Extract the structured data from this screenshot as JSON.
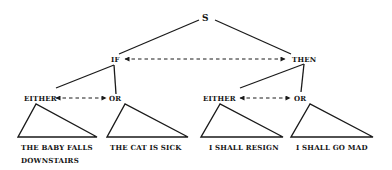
{
  "diagram": {
    "root": {
      "label": "S"
    },
    "level1": [
      {
        "id": "if",
        "label": "IF"
      },
      {
        "id": "then",
        "label": "THEN"
      }
    ],
    "level1_relation": {
      "from": "IF",
      "to": "THEN",
      "style": "dashed-bidirectional-arrow"
    },
    "level2": [
      {
        "parent": "IF",
        "either": "EITHER",
        "or": "OR"
      },
      {
        "parent": "THEN",
        "either": "EITHER",
        "or": "OR"
      }
    ],
    "leaves": [
      {
        "parent": "IF/EITHER",
        "line1": "THE BABY FALLS",
        "line2": "DOWNSTAIRS"
      },
      {
        "parent": "IF/OR",
        "line1": "THE CAT IS SICK",
        "line2": ""
      },
      {
        "parent": "THEN/EITHER",
        "line1": "I SHALL RESIGN",
        "line2": ""
      },
      {
        "parent": "THEN/OR",
        "line1": "I SHALL GO MAD",
        "line2": ""
      }
    ],
    "colors": {
      "ink": "#1a1a1a",
      "background": "#ffffff"
    }
  }
}
